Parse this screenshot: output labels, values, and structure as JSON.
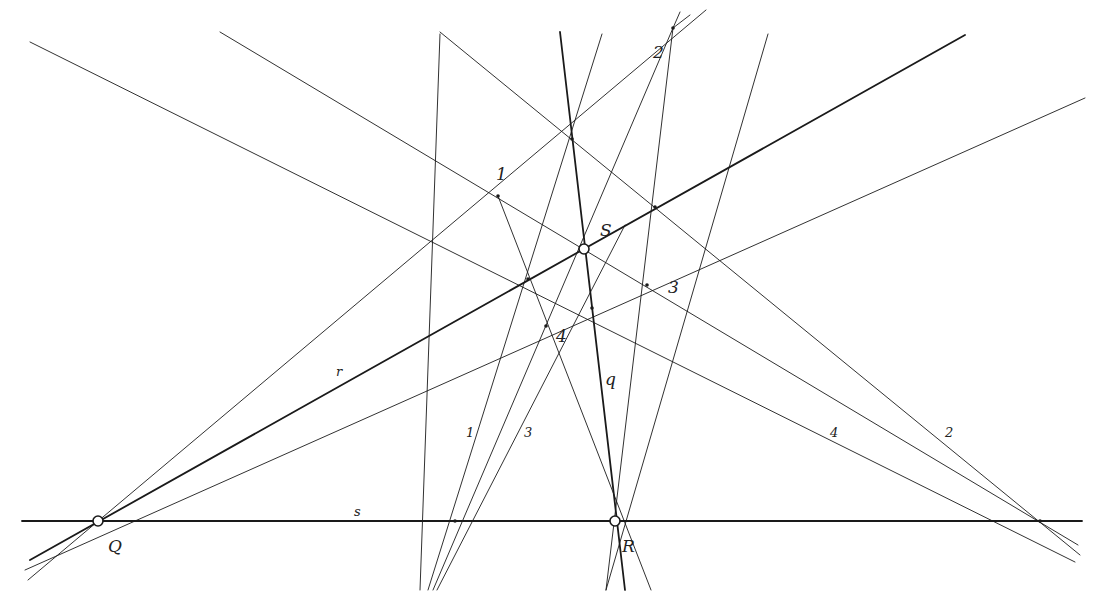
{
  "diagram": {
    "type": "projective-geometry-construction",
    "stroke_color": "#1a1a1a",
    "background": "#ffffff",
    "points": {
      "Q": {
        "x": 98,
        "y": 521,
        "label": "Q",
        "marker": "circle"
      },
      "R": {
        "x": 615,
        "y": 521,
        "label": "R",
        "marker": "circle"
      },
      "S": {
        "x": 584,
        "y": 249,
        "label": "S",
        "marker": "circle"
      },
      "A": {
        "x": 455,
        "y": 521,
        "label": "",
        "marker": "dot"
      },
      "B": {
        "x": 1040,
        "y": 521,
        "label": "",
        "marker": "dot"
      },
      "P2": {
        "x": 673,
        "y": 28,
        "label": "2",
        "marker": "dot"
      },
      "T": {
        "x": 572,
        "y": 139,
        "label": "",
        "marker": "dot"
      },
      "P1": {
        "x": 498,
        "y": 196,
        "label": "1",
        "marker": "dot"
      },
      "U": {
        "x": 655,
        "y": 207,
        "label": "",
        "marker": "dot"
      },
      "V": {
        "x": 528,
        "y": 279,
        "label": "",
        "marker": "dot"
      },
      "P3": {
        "x": 647,
        "y": 285,
        "label": "3",
        "marker": "dot"
      },
      "W": {
        "x": 592,
        "y": 308,
        "label": "",
        "marker": "dot"
      },
      "P4": {
        "x": 546,
        "y": 326,
        "label": "4",
        "marker": "dot"
      }
    },
    "labels": [
      {
        "text": "Q",
        "x": 108,
        "y": 552,
        "size": "lg"
      },
      {
        "text": "R",
        "x": 622,
        "y": 552,
        "size": "lg"
      },
      {
        "text": "S",
        "x": 600,
        "y": 236,
        "size": "lg"
      },
      {
        "text": "2",
        "x": 653,
        "y": 58,
        "size": "lg"
      },
      {
        "text": "1",
        "x": 496,
        "y": 180,
        "size": "lg"
      },
      {
        "text": "3",
        "x": 668,
        "y": 293,
        "size": "lg"
      },
      {
        "text": "4",
        "x": 556,
        "y": 342,
        "size": "lg"
      },
      {
        "text": "q",
        "x": 605,
        "y": 385,
        "size": "lg"
      },
      {
        "text": "r",
        "x": 336,
        "y": 376,
        "size": "sm"
      },
      {
        "text": "s",
        "x": 354,
        "y": 516,
        "size": "sm"
      },
      {
        "text": "1",
        "x": 466,
        "y": 437,
        "size": "sm"
      },
      {
        "text": "3",
        "x": 524,
        "y": 437,
        "size": "sm"
      },
      {
        "text": "4",
        "x": 830,
        "y": 437,
        "size": "sm"
      },
      {
        "text": "2",
        "x": 945,
        "y": 437,
        "size": "sm"
      }
    ],
    "lines": [
      {
        "name": "line-s",
        "x1": 22,
        "y1": 521,
        "x2": 1082,
        "y2": 521,
        "weight": 1.8
      },
      {
        "name": "line-r",
        "x1": 30,
        "y1": 560,
        "x2": 965,
        "y2": 35,
        "weight": 1.8
      },
      {
        "name": "line-q",
        "x1": 560,
        "y1": 32,
        "x2": 625,
        "y2": 590,
        "weight": 1.8
      },
      {
        "name": "line-Q-1-2",
        "x1": 28,
        "y1": 580,
        "x2": 706,
        "y2": 10,
        "weight": 0.9
      },
      {
        "name": "line-Q-4-3",
        "x1": 25,
        "y1": 570,
        "x2": 1085,
        "y2": 98,
        "weight": 0.9
      },
      {
        "name": "line-B-U-T",
        "x1": 440,
        "y1": 32,
        "x2": 1080,
        "y2": 555,
        "weight": 0.9
      },
      {
        "name": "line-B-3-1",
        "x1": 220,
        "y1": 32,
        "x2": 1078,
        "y2": 545,
        "weight": 0.9
      },
      {
        "name": "line-B-W-V",
        "x1": 30,
        "y1": 42,
        "x2": 1075,
        "y2": 562,
        "weight": 0.9
      },
      {
        "name": "line-A-1",
        "x1": 440,
        "y1": 34,
        "x2": 420,
        "y2": 590,
        "weight": 0.9
      },
      {
        "name": "line-A-T",
        "x1": 602,
        "y1": 34,
        "x2": 428,
        "y2": 590,
        "weight": 0.9
      },
      {
        "name": "line-A-2",
        "x1": 673,
        "y1": 28,
        "x2": 433,
        "y2": 590,
        "weight": 0.9
      },
      {
        "name": "line-A-W",
        "x1": 625,
        "y1": 225,
        "x2": 437,
        "y2": 590,
        "weight": 0.9
      },
      {
        "name": "line-R-1",
        "x1": 498,
        "y1": 196,
        "x2": 651,
        "y2": 590,
        "weight": 0.9
      },
      {
        "name": "line-R-2",
        "x1": 673,
        "y1": 28,
        "x2": 606,
        "y2": 590,
        "weight": 0.9
      },
      {
        "name": "line-R-U",
        "x1": 768,
        "y1": 34,
        "x2": 606,
        "y2": 590,
        "weight": 0.9
      },
      {
        "name": "line-2-V",
        "x1": 690,
        "y1": 15,
        "x2": 673,
        "y2": 28,
        "weight": 0.9
      },
      {
        "name": "line-2-V2",
        "x1": 680,
        "y1": 12,
        "x2": 673,
        "y2": 28,
        "weight": 0.9
      }
    ]
  }
}
